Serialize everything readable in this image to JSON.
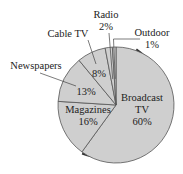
{
  "chart_data": {
    "type": "pie",
    "title": "",
    "start_angle": "12 o'clock",
    "direction": "clockwise",
    "slices": [
      {
        "label": "Broadcast TV",
        "label_lines": [
          "Broadcast",
          "TV"
        ],
        "value": 60,
        "value_label": "60%",
        "label_placement": "inside"
      },
      {
        "label": "Magazines",
        "label_lines": [
          "Magazines"
        ],
        "value": 16,
        "value_label": "16%",
        "label_placement": "inside"
      },
      {
        "label": "Newspapers",
        "label_lines": [
          "Newspapers"
        ],
        "value": 13,
        "value_label": "13%",
        "label_placement": "outside-leader"
      },
      {
        "label": "Cable TV",
        "label_lines": [
          "Cable TV"
        ],
        "value": 8,
        "value_label": "8%",
        "label_placement": "outside-leader"
      },
      {
        "label": "Radio",
        "label_lines": [
          "Radio"
        ],
        "value": 2,
        "value_label": "2%",
        "label_placement": "outside-leader"
      },
      {
        "label": "Outdoor",
        "label_lines": [
          "Outdoor"
        ],
        "value": 1,
        "value_label": "1%",
        "label_placement": "outside-leader"
      }
    ],
    "legend": "none",
    "colors": {
      "fill": "#cfcfcf",
      "stroke": "#555555",
      "shadow": "#333333",
      "text": "#222222"
    }
  }
}
